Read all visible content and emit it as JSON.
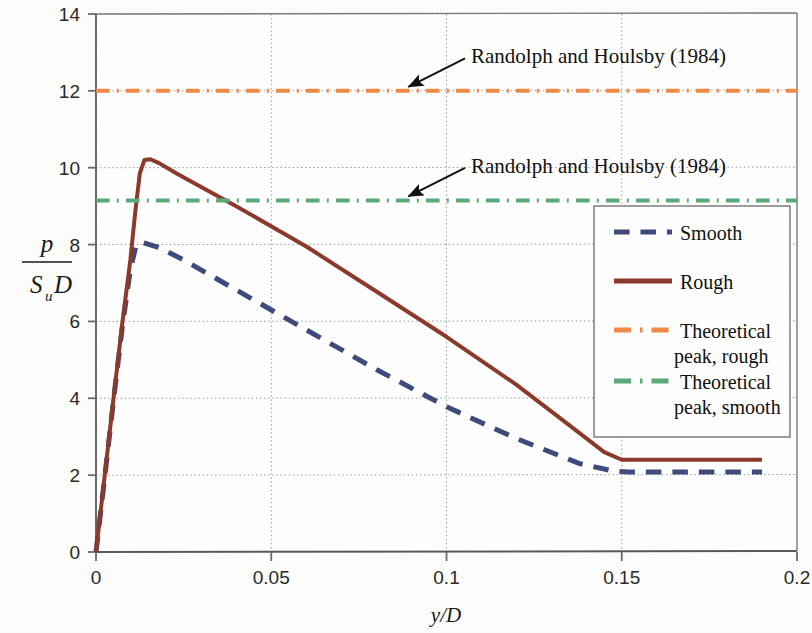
{
  "chart_data": {
    "type": "line",
    "title": "",
    "xlabel": "y/D",
    "ylabel": "p / (Su D)",
    "ylabel_numerator": "p",
    "ylabel_denominator_main": "S",
    "ylabel_denominator_sub": "u",
    "ylabel_denominator_tail": "D",
    "xlim": [
      0,
      0.2
    ],
    "ylim": [
      0,
      14
    ],
    "grid": true,
    "grid_style": "dotted",
    "legend_position": "right-middle",
    "xticks": [
      0,
      0.05,
      0.1,
      0.15,
      0.2
    ],
    "xtick_labels": [
      "0",
      "0.05",
      "0.1",
      "0.15",
      "0.2"
    ],
    "yticks": [
      0,
      2,
      4,
      6,
      8,
      10,
      12,
      14
    ],
    "ytick_labels": [
      "0",
      "2",
      "4",
      "6",
      "8",
      "10",
      "12",
      "14"
    ],
    "series": [
      {
        "name": "Smooth",
        "color": "#3e4b7c",
        "style": "dashed",
        "width": 5,
        "points": [
          [
            0.0,
            0.0
          ],
          [
            0.0025,
            1.95
          ],
          [
            0.005,
            3.95
          ],
          [
            0.0075,
            5.85
          ],
          [
            0.0098,
            7.35
          ],
          [
            0.0115,
            8.0
          ],
          [
            0.0135,
            8.05
          ],
          [
            0.018,
            7.92
          ],
          [
            0.025,
            7.6
          ],
          [
            0.04,
            6.82
          ],
          [
            0.06,
            5.78
          ],
          [
            0.08,
            4.75
          ],
          [
            0.1,
            3.78
          ],
          [
            0.12,
            2.95
          ],
          [
            0.138,
            2.3
          ],
          [
            0.148,
            2.1
          ],
          [
            0.152,
            2.08
          ],
          [
            0.165,
            2.08
          ],
          [
            0.19,
            2.08
          ]
        ]
      },
      {
        "name": "Rough",
        "color": "#8c3a2c",
        "style": "solid",
        "width": 4,
        "points": [
          [
            0.0,
            0.0
          ],
          [
            0.0025,
            2.0
          ],
          [
            0.005,
            4.0
          ],
          [
            0.0075,
            5.95
          ],
          [
            0.0098,
            7.6
          ],
          [
            0.0112,
            8.85
          ],
          [
            0.0125,
            9.85
          ],
          [
            0.0138,
            10.2
          ],
          [
            0.0155,
            10.22
          ],
          [
            0.018,
            10.12
          ],
          [
            0.023,
            9.85
          ],
          [
            0.03,
            9.5
          ],
          [
            0.04,
            9.0
          ],
          [
            0.06,
            7.95
          ],
          [
            0.08,
            6.78
          ],
          [
            0.1,
            5.6
          ],
          [
            0.12,
            4.35
          ],
          [
            0.135,
            3.3
          ],
          [
            0.145,
            2.6
          ],
          [
            0.15,
            2.4
          ],
          [
            0.16,
            2.4
          ],
          [
            0.19,
            2.4
          ]
        ]
      },
      {
        "name": "Theoretical peak, rough",
        "color": "#f08a46",
        "style": "dash-dot",
        "width": 4,
        "constant_value": 12.0,
        "points": [
          [
            0.0,
            12.0
          ],
          [
            0.2,
            12.0
          ]
        ]
      },
      {
        "name": "Theoretical peak, smooth",
        "color": "#5aab78",
        "style": "dash-dot",
        "width": 4,
        "constant_value": 9.15,
        "points": [
          [
            0.0,
            9.15
          ],
          [
            0.2,
            9.15
          ]
        ]
      }
    ],
    "annotations": [
      {
        "text": "Randolph and Houlsby (1984)",
        "target_x": 0.088,
        "target_y": 12.0,
        "text_x": 0.107,
        "text_y": 12.95
      },
      {
        "text": "Randolph and Houlsby (1984)",
        "target_x": 0.088,
        "target_y": 9.15,
        "text_x": 0.107,
        "text_y": 10.1
      }
    ]
  },
  "legend": {
    "entries": [
      {
        "label": "Smooth",
        "color": "#3e4b7c",
        "style": "dashed"
      },
      {
        "label": "Rough",
        "color": "#8c3a2c",
        "style": "solid"
      },
      {
        "label": "Theoretical",
        "label2": "peak, rough",
        "color": "#f08a46",
        "style": "dash-dot"
      },
      {
        "label": "Theoretical",
        "label2": "peak, smooth",
        "color": "#5aab78",
        "style": "dash-dot"
      }
    ]
  },
  "axes": {
    "x_title": "y/D",
    "x_title_italic_y": "y",
    "x_title_slash": "/",
    "x_title_italic_d": "D"
  },
  "colors": {
    "axis": "#6b6b6b",
    "grid": "#9a9a9a",
    "text": "#1a1a1a",
    "smooth": "#3e4b7c",
    "rough": "#8c3a2c",
    "theoretical_rough": "#f08a46",
    "theoretical_smooth": "#5aab78"
  }
}
